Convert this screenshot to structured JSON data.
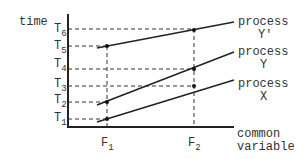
{
  "diagram": {
    "y_axis_label": "time",
    "x_axis_label_line1": "common",
    "x_axis_label_line2": "variable",
    "y_ticks": [
      {
        "letter": "T",
        "sub": "1"
      },
      {
        "letter": "T",
        "sub": "2"
      },
      {
        "letter": "T",
        "sub": "3"
      },
      {
        "letter": "T",
        "sub": "4"
      },
      {
        "letter": "T",
        "sub": "5"
      },
      {
        "letter": "T",
        "sub": "6"
      }
    ],
    "x_ticks": [
      {
        "letter": "F",
        "sub": "1"
      },
      {
        "letter": "F",
        "sub": "2"
      }
    ],
    "processes": [
      {
        "line1": "process",
        "line2": "Y'",
        "at_F1": "T5",
        "at_F2": "T6"
      },
      {
        "line1": "process",
        "line2": "Y",
        "at_F1": "T2",
        "at_F2": "T4"
      },
      {
        "line1": "process",
        "line2": "X",
        "at_F1": "T1",
        "at_F2": "T3"
      }
    ]
  }
}
